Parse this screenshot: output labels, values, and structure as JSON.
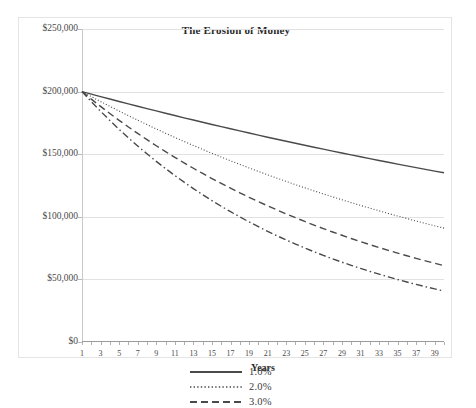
{
  "clipped_top_text": "",
  "chart": {
    "title": "The Erosion of Money",
    "xlabel": "Years",
    "ylabel": ""
  },
  "axis": {
    "y_ticks": [
      "$0",
      "$50,000",
      "$100,000",
      "$150,000",
      "$200,000",
      "$250,000"
    ],
    "x_ticks": [
      "1",
      "3",
      "5",
      "7",
      "9",
      "11",
      "13",
      "15",
      "17",
      "19",
      "21",
      "23",
      "25",
      "27",
      "29",
      "31",
      "33",
      "35",
      "37",
      "39"
    ]
  },
  "legend": {
    "items": [
      {
        "label": "1.0%",
        "style": "solid"
      },
      {
        "label": "2.0%",
        "style": "dotted"
      },
      {
        "label": "3.0%",
        "style": "dashed"
      }
    ]
  },
  "colors": {
    "line": "#4a4a4a",
    "grid": "#e1e1e1",
    "frame": "#e4e4e4",
    "text": "#3a3a3a"
  },
  "chart_data": {
    "type": "line",
    "title": "The Erosion of Money",
    "xlabel": "Years",
    "ylabel": "",
    "xlim": [
      1,
      40
    ],
    "ylim": [
      0,
      250000
    ],
    "grid": true,
    "legend_position": "bottom",
    "x": [
      1,
      2,
      3,
      4,
      5,
      6,
      7,
      8,
      9,
      10,
      11,
      12,
      13,
      14,
      15,
      16,
      17,
      18,
      19,
      20,
      21,
      22,
      23,
      24,
      25,
      26,
      27,
      28,
      29,
      30,
      31,
      32,
      33,
      34,
      35,
      36,
      37,
      38,
      39,
      40
    ],
    "series": [
      {
        "name": "1.0%",
        "style": "solid",
        "values": [
          200000,
          198000,
          196020,
          194060,
          192119,
          190198,
          188296,
          186413,
          184549,
          182703,
          180876,
          179067,
          177277,
          175504,
          173749,
          172011,
          170291,
          168588,
          166902,
          165233,
          163581,
          161945,
          160326,
          158722,
          157135,
          155564,
          154008,
          152468,
          150943,
          149434,
          147940,
          146460,
          144996,
          143546,
          142110,
          140689,
          139282,
          137889,
          136510,
          135145
        ]
      },
      {
        "name": "2.0%",
        "style": "dotted",
        "values": [
          200000,
          196000,
          192080,
          188238,
          184474,
          180784,
          177168,
          173625,
          170152,
          166749,
          163414,
          160146,
          156943,
          153804,
          150728,
          147714,
          144759,
          141864,
          139027,
          136246,
          133521,
          130851,
          128234,
          125669,
          123156,
          120693,
          118279,
          115913,
          113595,
          111323,
          109097,
          106915,
          104776,
          102681,
          100627,
          98615,
          96642,
          94709,
          92815,
          90959
        ]
      },
      {
        "name": "3.0%",
        "style": "dashed",
        "values": [
          200000,
          194000,
          188180,
          182535,
          177059,
          171747,
          166595,
          161597,
          156749,
          152047,
          147485,
          143061,
          138769,
          134606,
          130568,
          126651,
          122852,
          119167,
          115592,
          112124,
          108760,
          105498,
          102333,
          99263,
          96285,
          93396,
          90594,
          87876,
          85240,
          82683,
          80203,
          77797,
          75463,
          73199,
          71003,
          68873,
          66807,
          64803,
          62859,
          60973
        ]
      },
      {
        "name": "4.0%",
        "style": "dashdot",
        "values": [
          200000,
          192000,
          184320,
          176947,
          169869,
          163074,
          156551,
          150289,
          144277,
          138506,
          132966,
          127647,
          122541,
          117640,
          112934,
          108417,
          104080,
          99917,
          95920,
          92083,
          88400,
          84864,
          81469,
          78210,
          75082,
          72078,
          69195,
          66427,
          63770,
          61219,
          58770,
          56419,
          54162,
          51996,
          49916,
          47919,
          46002,
          44162,
          42395,
          40699
        ]
      }
    ]
  }
}
